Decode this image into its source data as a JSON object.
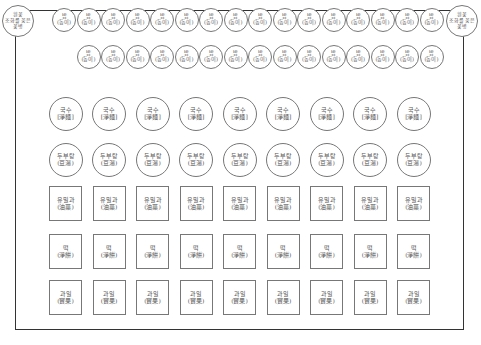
{
  "diagram": {
    "frame": {
      "border_color": "#333333"
    },
    "vase_left": {
      "line1": "흰꽃",
      "line2": "조화를 꽂은",
      "line3": "꽃병"
    },
    "vase_right": {
      "line1": "흰꽃",
      "line2": "조화를 꽂은",
      "line3": "꽃병"
    },
    "rice_row1": {
      "count": 16,
      "label": "밥",
      "sub": "(동이)"
    },
    "rice_row2": {
      "count": 15,
      "label": "밥",
      "sub": "(동이)"
    },
    "rows": [
      {
        "name": "noodles",
        "shape": "circle",
        "count": 9,
        "label": "국수",
        "sub": "[淨麵]"
      },
      {
        "name": "tofu-soup",
        "shape": "circle",
        "count": 9,
        "label": "두부탕",
        "sub": "(豆湯)"
      },
      {
        "name": "yumilgwa",
        "shape": "square",
        "count": 9,
        "label": "유밀과",
        "sub": "(油菓)"
      },
      {
        "name": "rice-cake",
        "shape": "square",
        "count": 9,
        "label": "떡",
        "sub": "(淨餠)"
      },
      {
        "name": "fruit",
        "shape": "square",
        "count": 9,
        "label": "과일",
        "sub": "(實果)"
      }
    ]
  }
}
